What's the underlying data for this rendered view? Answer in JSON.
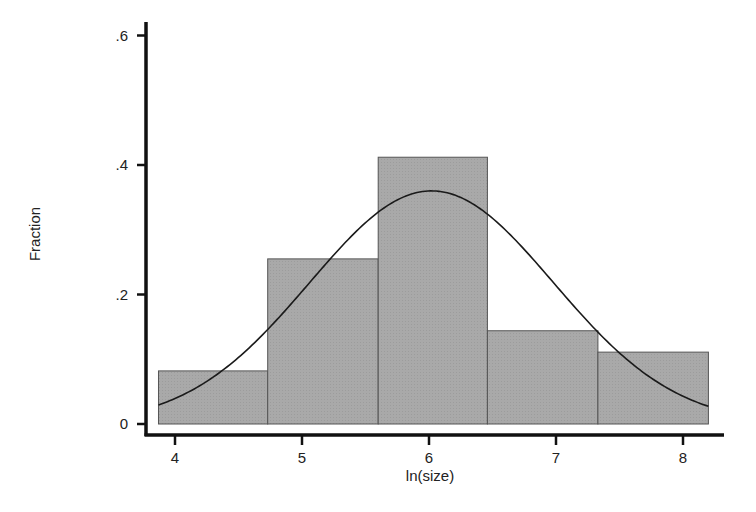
{
  "chart_data": {
    "type": "bar",
    "subtype": "histogram_with_normal_density",
    "title": "",
    "xlabel": "ln(size)",
    "ylabel": "Fraction",
    "xlim": [
      3.87,
      8.2
    ],
    "ylim": [
      0,
      0.62
    ],
    "grid": false,
    "legend": null,
    "x_ticks": [
      4,
      5,
      6,
      7,
      8
    ],
    "x_tick_labels": [
      "4",
      "5",
      "6",
      "7",
      "8"
    ],
    "y_ticks": [
      0,
      0.2,
      0.4,
      0.6
    ],
    "y_tick_labels": [
      "0",
      ".2",
      ".4",
      ".6"
    ],
    "bin_edges": [
      3.87,
      4.73,
      5.6,
      6.46,
      7.33,
      8.2
    ],
    "categories": [
      "3.87-4.73",
      "4.73-5.60",
      "5.60-6.46",
      "6.46-7.33",
      "7.33-8.20"
    ],
    "values": [
      0.082,
      0.255,
      0.412,
      0.144,
      0.111
    ],
    "overlay": {
      "type": "line",
      "name": "normal density",
      "mean": 6.02,
      "sd": 0.96,
      "peak": 0.36
    },
    "colors": {
      "bar_fill": "#a8a8a8",
      "bar_edge": "#555555",
      "curve": "#1a1a1a",
      "axis": "#111111"
    }
  }
}
